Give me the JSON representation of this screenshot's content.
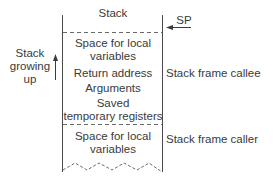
{
  "diagram": {
    "title": "Stack",
    "sp_label": "SP",
    "growth_label_lines": [
      "Stack",
      "growing",
      "up"
    ],
    "cells": [
      {
        "lines": [
          "Space for local",
          "variables"
        ]
      },
      {
        "lines": [
          "Return address"
        ]
      },
      {
        "lines": [
          "Arguments"
        ]
      },
      {
        "lines": [
          "Saved",
          "temporary registers"
        ]
      },
      {
        "lines": [
          "Space for local",
          "variables"
        ]
      }
    ],
    "frame_labels": {
      "callee": "Stack frame callee",
      "caller": "Stack frame caller"
    },
    "colors": {
      "line": "#4a4a4a",
      "text": "#3a3a3a"
    }
  }
}
